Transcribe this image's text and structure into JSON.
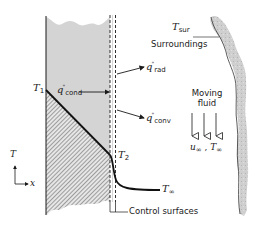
{
  "figure": {
    "type": "energy-balance-schematic",
    "colors": {
      "ink": "#1a1a1a",
      "wall_fill": "#d4d4d4",
      "surroundings_fill": "#c8c8c8",
      "background": "#ffffff"
    }
  },
  "labels": {
    "t_sur": {
      "symbol": "T",
      "sub": "sur"
    },
    "surroundings": "Surroundings",
    "q_rad": {
      "symbol": "q",
      "sup": "\"",
      "sub": "rad"
    },
    "q_cond": {
      "symbol": "q",
      "sup": "\"",
      "sub": "cond"
    },
    "q_conv": {
      "symbol": "q",
      "sup": "\"",
      "sub": "conv"
    },
    "t1": {
      "symbol": "T",
      "sub": "1"
    },
    "t2": {
      "symbol": "T",
      "sub": "2"
    },
    "t_inf": {
      "symbol": "T",
      "sub": "∞"
    },
    "moving_fluid_line1": "Moving",
    "moving_fluid_line2": "fluid",
    "free_stream": {
      "u": "u",
      "u_sub": "∞",
      "sep": " , ",
      "t": "T",
      "t_sub": "∞"
    },
    "control_surfaces": "Control surfaces",
    "axis_t": "T",
    "axis_x": "x"
  }
}
